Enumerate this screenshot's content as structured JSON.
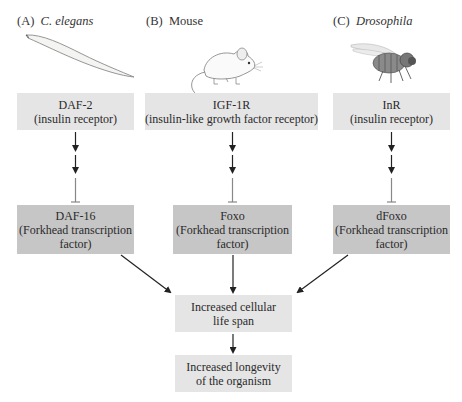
{
  "columns": [
    {
      "panel_letter": "(A)",
      "organism": "C. elegans",
      "organism_italic": true,
      "organism_icon": "worm-icon",
      "receptor": {
        "name": "DAF-2",
        "desc": "(insulin receptor)"
      },
      "transcription_factor": {
        "name": "DAF-16",
        "desc_line1": "(Forkhead transcription",
        "desc_line2": "factor)"
      }
    },
    {
      "panel_letter": "(B)",
      "organism": "Mouse",
      "organism_italic": false,
      "organism_icon": "mouse-icon",
      "receptor": {
        "name": "IGF-1R",
        "desc": "(insulin-like growth factor receptor)"
      },
      "transcription_factor": {
        "name": "Foxo",
        "desc_line1": "(Forkhead transcription",
        "desc_line2": "factor)"
      }
    },
    {
      "panel_letter": "(C)",
      "organism": "Drosophila",
      "organism_italic": true,
      "organism_icon": "fly-icon",
      "receptor": {
        "name": "InR",
        "desc": "(insulin receptor)"
      },
      "transcription_factor": {
        "name": "dFoxo",
        "desc_line1": "(Forkhead transcription",
        "desc_line2": "factor)"
      }
    }
  ],
  "outcomes": [
    {
      "line1": "Increased cellular",
      "line2": "life span"
    },
    {
      "line1": "Increased longevity",
      "line2": "of the organism"
    }
  ],
  "colors": {
    "receptor_box": "#e5e5e5",
    "transcription_factor_box": "#c6c6c6",
    "outcome_box": "#e5e5e5",
    "arrow": "#222222",
    "inhibition_line": "#888888"
  }
}
